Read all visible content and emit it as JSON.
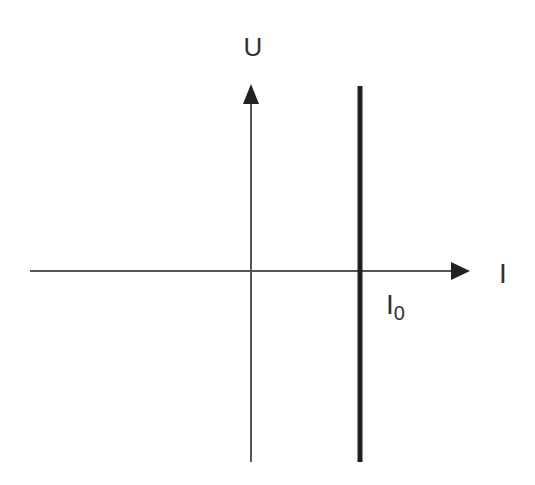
{
  "diagram": {
    "title": "",
    "type": "current-voltage characteristic (ideal current source)",
    "axes": {
      "y_label": "U",
      "x_label": "I"
    },
    "marker": {
      "label_main": "I",
      "label_sub": "0"
    },
    "colors": {
      "axis": "#444444",
      "characteristic": "#222222",
      "text": "#333333",
      "background": "#ffffff"
    }
  }
}
